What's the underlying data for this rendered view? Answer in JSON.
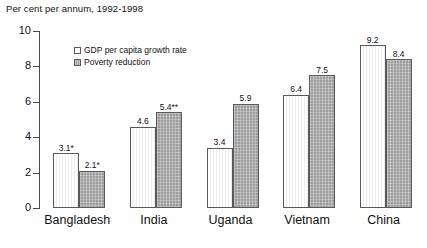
{
  "chart_data": {
    "type": "bar",
    "title": "Per cent per annum, 1992-1998",
    "xlabel": "",
    "ylabel": "",
    "ylim": [
      0,
      10
    ],
    "yticks": [
      0,
      2,
      4,
      6,
      8,
      10
    ],
    "ytick_labels": [
      "0",
      "2",
      "4",
      "6",
      "8",
      "10"
    ],
    "grid": false,
    "legend_position": "upper left inside",
    "categories": [
      "Bangladesh",
      "India",
      "Uganda",
      "Vietnam",
      "China"
    ],
    "series": [
      {
        "name": "GDP per capita growth rate",
        "values": [
          3.1,
          4.6,
          3.4,
          6.4,
          9.2
        ],
        "data_labels": [
          "3.1*",
          "4.6",
          "3.4",
          "6.4",
          "9.2"
        ],
        "fill": "white-vertical-hatch",
        "color": "#fbfbfb"
      },
      {
        "name": "Poverty reduction",
        "values": [
          2.1,
          5.4,
          5.9,
          7.5,
          8.4
        ],
        "data_labels": [
          "2.1*",
          "5.4**",
          "5.9",
          "7.5",
          "8.4"
        ],
        "fill": "grey-crosshatch",
        "color": "#9d9d9d"
      }
    ]
  },
  "legend": {
    "items": [
      {
        "label": "GDP per capita growth rate"
      },
      {
        "label": "Poverty reduction"
      }
    ]
  },
  "colors": {
    "axis": "#4a4a4a",
    "text": "#111111",
    "series0": "#fbfbfb",
    "series1": "#9d9d9d",
    "background": "#ffffff"
  }
}
